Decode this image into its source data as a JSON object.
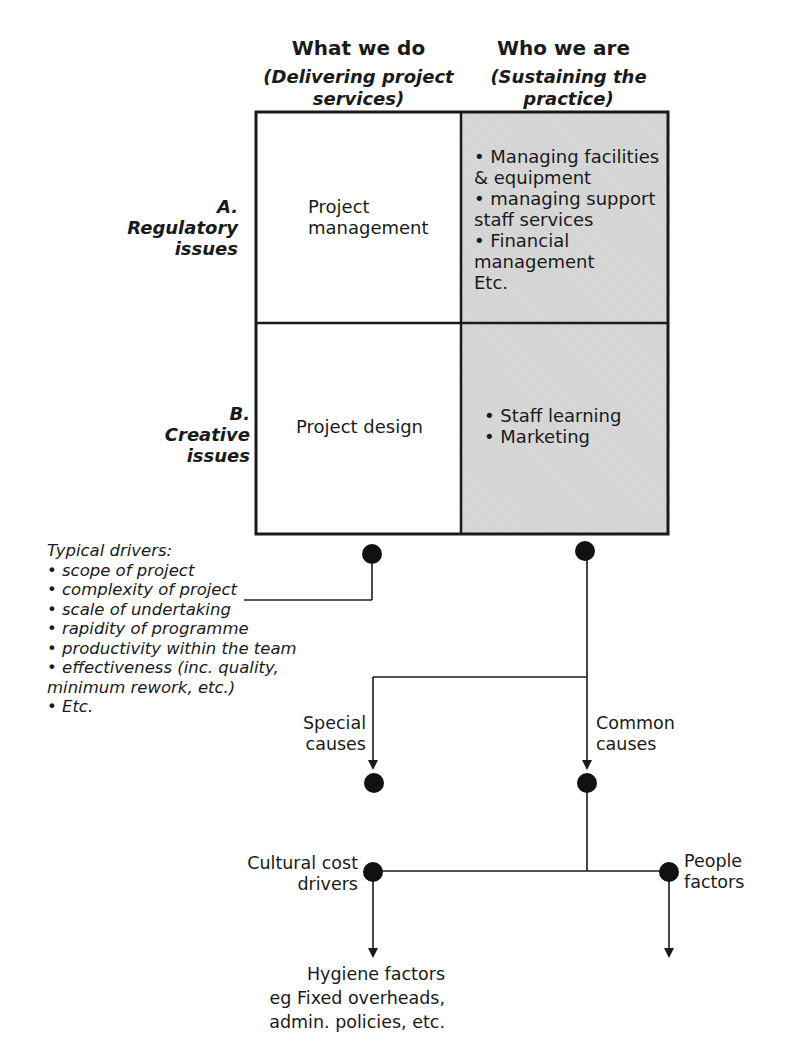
{
  "columns": [
    {
      "title": "What we do",
      "subtitle_line1": "(Delivering project",
      "subtitle_line2": "services)"
    },
    {
      "title": "Who we are",
      "subtitle_line1": "(Sustaining the",
      "subtitle_line2": "practice)"
    }
  ],
  "rows": [
    {
      "letter": "A.",
      "label_line1": "Regulatory",
      "label_line2": "issues"
    },
    {
      "letter": "B.",
      "label_line1": "Creative",
      "label_line2": "issues"
    }
  ],
  "cells": {
    "a_left": {
      "line1": "Project",
      "line2": "management"
    },
    "a_right": {
      "lines": [
        "• Managing facilities",
        "& equipment",
        "• managing support",
        "staff services",
        "• Financial",
        "management",
        "Etc."
      ]
    },
    "b_left": {
      "text": "Project design"
    },
    "b_right": {
      "lines": [
        "• Staff learning",
        "• Marketing"
      ]
    }
  },
  "typical_drivers": {
    "heading": "Typical drivers:",
    "lines": [
      "• scope of project",
      "• complexity of project",
      "• scale of undertaking",
      "• rapidity of programme",
      "• productivity within the team",
      "• effectiveness (inc. quality,",
      "minimum rework, etc.)",
      "• Etc."
    ]
  },
  "nodes": {
    "special_causes": {
      "line1": "Special",
      "line2": "causes"
    },
    "common_causes": {
      "line1": "Common",
      "line2": "causes"
    },
    "cultural_cost_drivers": {
      "line1": "Cultural cost",
      "line2": "drivers"
    },
    "people_factors": {
      "line1": "People",
      "line2": "factors"
    },
    "hygiene_factors": {
      "line1": "Hygiene factors",
      "line2": "eg Fixed overheads,",
      "line3": "admin. policies, etc."
    }
  },
  "colors": {
    "line": "#1a1a1a",
    "shade": "#d3d3d3",
    "background": "#ffffff"
  }
}
